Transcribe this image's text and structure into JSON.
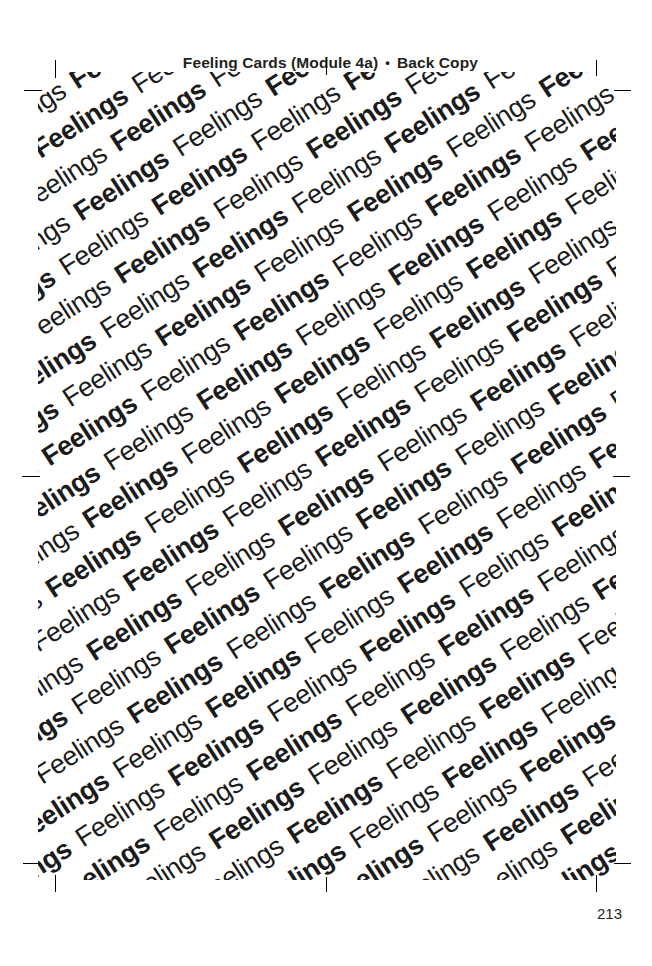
{
  "page": {
    "width": 652,
    "height": 966,
    "background_color": "#ffffff",
    "ink_color": "#231f20"
  },
  "running_head": {
    "title": "Feeling Cards (Module 4a)",
    "separator": "•",
    "subtitle": "Back Copy",
    "full_text": "Feeling Cards (Module 4a) • Back Copy"
  },
  "card_art": {
    "name": "feelings-pattern",
    "repeated_word": "Feelings",
    "weights": [
      "bold",
      "regular"
    ],
    "rotation_degrees": -33,
    "text_color": "#1b1b1b",
    "background_color": "#ffffff",
    "rows": 40,
    "words_per_row": 26,
    "description": "Back of card: the word Feelings repeated on diagonal lines, alternating bold and regular"
  },
  "crop_marks": {
    "name": "registration-marks",
    "count": 8,
    "positions": [
      "top-left-vertical",
      "top-left-horizontal",
      "top-right-vertical",
      "top-right-horizontal",
      "bottom-left-vertical",
      "bottom-left-horizontal",
      "bottom-right-vertical",
      "bottom-right-horizontal",
      "top-center-vertical",
      "bottom-center-vertical",
      "left-center-horizontal",
      "right-center-horizontal"
    ]
  },
  "folio": {
    "page_number": "213"
  }
}
